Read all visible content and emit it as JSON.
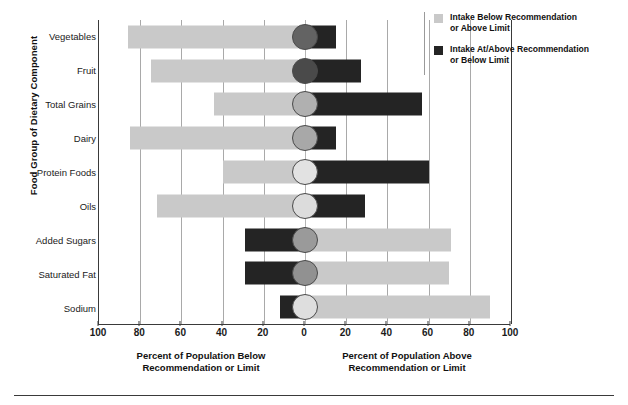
{
  "axes": {
    "y_title": "Food Group of Dietary Component",
    "x_caption_left": "Percent of Population Below\nRecommendation or Limit",
    "x_caption_right": "Percent of Population Above\nRecommendation or Limit",
    "tick_labels": [
      "100",
      "80",
      "60",
      "40",
      "20",
      "0",
      "20",
      "40",
      "60",
      "80",
      "100"
    ],
    "tick_values": [
      -100,
      -80,
      -60,
      -40,
      -20,
      0,
      20,
      40,
      60,
      80,
      100
    ]
  },
  "legend": {
    "position": "top-right",
    "items": [
      {
        "label": "Intake Below Recommendation\nor Above Limit",
        "color": "#c9c9c9",
        "name": "below-recommendation"
      },
      {
        "label": "Intake At/Above Recommendation\nor Below Limit",
        "color": "#242424",
        "name": "at-above-recommendation"
      }
    ]
  },
  "colors": {
    "light_bar": "#c9c9c9",
    "dark_bar": "#242424",
    "grid": "#a9a9a9",
    "axis": "#3a3a3a",
    "background": "#ffffff"
  },
  "chart_data": {
    "type": "bar",
    "orientation": "horizontal-diverging",
    "title": "",
    "xlabel_left": "Percent of Population Below Recommendation or Limit",
    "xlabel_right": "Percent of Population Above Recommendation or Limit",
    "ylabel": "Food Group of Dietary Component",
    "xlim": [
      -100,
      100
    ],
    "grid": true,
    "categories": [
      "Vegetables",
      "Fruit",
      "Total Grains",
      "Dairy",
      "Protein Foods",
      "Oils",
      "Added Sugars",
      "Saturated Fat",
      "Sodium"
    ],
    "series": [
      {
        "name": "Intake Below Recommendation or Above Limit",
        "color": "#c9c9c9",
        "side": "mixed",
        "values": [
          86,
          75,
          44,
          85,
          40,
          72,
          71,
          70,
          90
        ]
      },
      {
        "name": "Intake At/Above Recommendation or Below Limit",
        "color": "#242424",
        "side": "mixed",
        "values": [
          15,
          27,
          57,
          15,
          60,
          29,
          29,
          29,
          12
        ]
      }
    ],
    "rows": [
      {
        "category": "Vegetables",
        "left_value": 86,
        "left_color": "#c9c9c9",
        "right_value": 15,
        "right_color": "#242424",
        "marker_fill": "#636363"
      },
      {
        "category": "Fruit",
        "left_value": 75,
        "left_color": "#c9c9c9",
        "right_value": 27,
        "right_color": "#242424",
        "marker_fill": "#4a4a4a"
      },
      {
        "category": "Total Grains",
        "left_value": 44,
        "left_color": "#c9c9c9",
        "right_value": 57,
        "right_color": "#242424",
        "marker_fill": "#b0b0b0"
      },
      {
        "category": "Dairy",
        "left_value": 85,
        "left_color": "#c9c9c9",
        "right_value": 15,
        "right_color": "#242424",
        "marker_fill": "#a8a8a8"
      },
      {
        "category": "Protein Foods",
        "left_value": 40,
        "left_color": "#c9c9c9",
        "right_value": 60,
        "right_color": "#242424",
        "marker_fill": "#e2e2e2"
      },
      {
        "category": "Oils",
        "left_value": 72,
        "left_color": "#c9c9c9",
        "right_value": 29,
        "right_color": "#242424",
        "marker_fill": "#dcdcdc"
      },
      {
        "category": "Added Sugars",
        "left_value": 29,
        "left_color": "#242424",
        "right_value": 71,
        "right_color": "#c9c9c9",
        "marker_fill": "#9a9a9a"
      },
      {
        "category": "Saturated Fat",
        "left_value": 29,
        "left_color": "#242424",
        "right_value": 70,
        "right_color": "#c9c9c9",
        "marker_fill": "#919191"
      },
      {
        "category": "Sodium",
        "left_value": 12,
        "left_color": "#242424",
        "right_value": 90,
        "right_color": "#c9c9c9",
        "marker_fill": "#dedede"
      }
    ]
  }
}
